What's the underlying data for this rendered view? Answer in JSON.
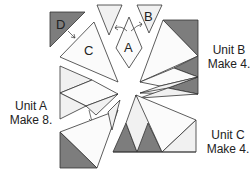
{
  "diagram": {
    "pieces": [
      {
        "id": "A",
        "label": "A"
      },
      {
        "id": "B",
        "label": "B"
      },
      {
        "id": "C",
        "label": "C"
      },
      {
        "id": "D",
        "label": "D"
      }
    ],
    "units": [
      {
        "id": "unit-a",
        "title": "Unit A",
        "instruction": "Make 8."
      },
      {
        "id": "unit-b",
        "title": "Unit B",
        "instruction": "Make 4."
      },
      {
        "id": "unit-c",
        "title": "Unit C",
        "instruction": "Make 4."
      }
    ],
    "colors": {
      "light_fabric": "#f1f1f1",
      "white_fabric": "#fbfbfb",
      "dark_fabric": "#7d7d7d",
      "outline": "#333333"
    }
  }
}
